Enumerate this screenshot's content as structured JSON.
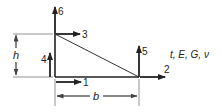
{
  "diagram": {
    "dof_labels": {
      "d1": "1",
      "d2": "2",
      "d3": "3",
      "d4": "4",
      "d5": "5",
      "d6": "6"
    },
    "dimensions": {
      "height": "h",
      "base": "b"
    },
    "properties_label": "t, E, G, ν",
    "colors": {
      "line": "#222222",
      "dimension": "#555555",
      "background": "#ffffff"
    }
  }
}
